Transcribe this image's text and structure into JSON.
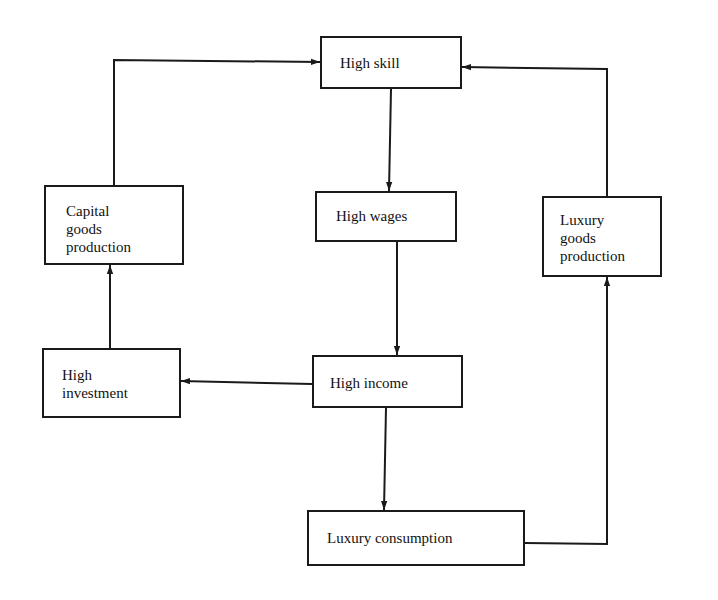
{
  "diagram": {
    "type": "flowchart",
    "nodes": {
      "high_skill": {
        "label": "High skill"
      },
      "capital_goods": {
        "label": "Capital\ngoods\nproduction"
      },
      "high_wages": {
        "label": "High wages"
      },
      "luxury_goods": {
        "label": "Luxury\ngoods\nproduction"
      },
      "high_investment": {
        "label": "High\ninvestment"
      },
      "high_income": {
        "label": "High income"
      },
      "luxury_consumption": {
        "label": "Luxury consumption"
      }
    },
    "edges": [
      {
        "from": "high_skill",
        "to": "high_wages"
      },
      {
        "from": "high_wages",
        "to": "high_income"
      },
      {
        "from": "high_income",
        "to": "high_investment"
      },
      {
        "from": "high_income",
        "to": "luxury_consumption"
      },
      {
        "from": "high_investment",
        "to": "capital_goods"
      },
      {
        "from": "capital_goods",
        "to": "high_skill"
      },
      {
        "from": "luxury_consumption",
        "to": "luxury_goods"
      },
      {
        "from": "luxury_goods",
        "to": "high_skill"
      }
    ],
    "colors": {
      "line": "#1a1a1a",
      "background": "#ffffff"
    }
  }
}
